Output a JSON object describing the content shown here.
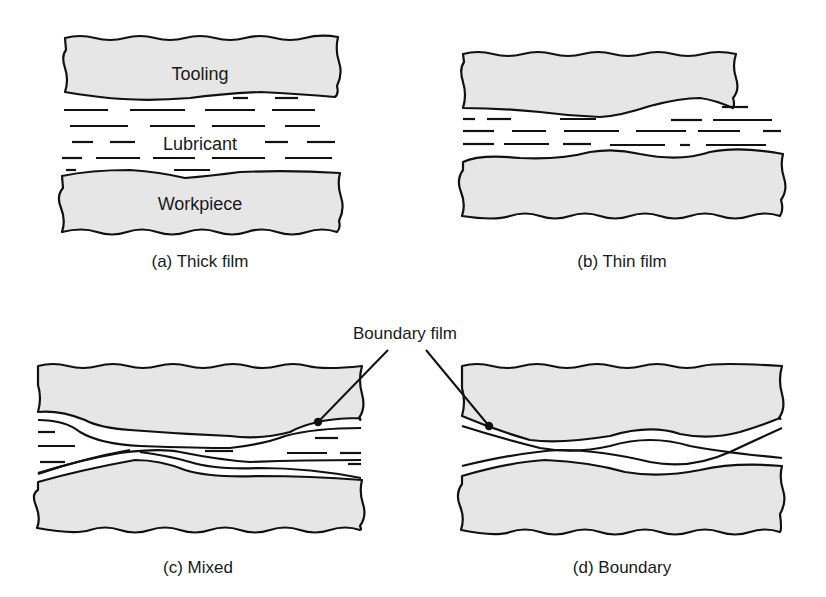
{
  "figure": {
    "colors": {
      "block_fill": "#e6e6e6",
      "outline": "#111111",
      "background": "#ffffff"
    },
    "panels": [
      {
        "id": "a",
        "caption": "(a) Thick film",
        "labels": {
          "top": "Tooling",
          "middle": "Lubricant",
          "bottom": "Workpiece"
        }
      },
      {
        "id": "b",
        "caption": "(b) Thin film"
      },
      {
        "id": "c",
        "caption": "(c) Mixed"
      },
      {
        "id": "d",
        "caption": "(d) Boundary"
      }
    ],
    "callout": {
      "label": "Boundary film"
    }
  }
}
